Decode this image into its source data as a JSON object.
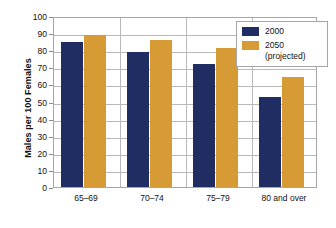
{
  "chart_data": {
    "type": "bar",
    "title": "",
    "subtitle": "",
    "xlabel": "",
    "ylabel": "Males per 100 Females",
    "categories": [
      "65–69",
      "70–74",
      "75–79",
      "80 and over"
    ],
    "series": [
      {
        "name": "2000",
        "color": "#1F2D62",
        "values": [
          85,
          79,
          72,
          52.5
        ]
      },
      {
        "name": "2050",
        "sublabel": "(projected)",
        "color": "#D79B35",
        "values": [
          89,
          86,
          81,
          64.5
        ]
      }
    ],
    "ylim": [
      0,
      100
    ],
    "ytick_step": 10,
    "yticks": [
      100,
      90,
      80,
      70,
      60,
      50,
      40,
      30,
      20,
      10,
      0
    ],
    "ytick_labels": [
      "100",
      "90",
      "80",
      "70",
      "60",
      "50",
      "40",
      "30",
      "20",
      "10",
      "0"
    ],
    "grid": true,
    "grid_axis": "y",
    "legend_position": "top-right",
    "legend_entries": [
      "2000",
      "2050 (projected)"
    ]
  },
  "legend": {
    "entries": [
      {
        "label": "2000",
        "sublabel": ""
      },
      {
        "label": "2050",
        "sublabel": "(projected)"
      }
    ]
  },
  "axis": {
    "y_title": "Males per 100 Females"
  },
  "colors": {
    "series_2000": "#1F2D62",
    "series_2050": "#D79B35",
    "gridline": "#b9b9b9",
    "frame": "#a6a6a6",
    "text": "#111111",
    "background": "#ffffff"
  }
}
